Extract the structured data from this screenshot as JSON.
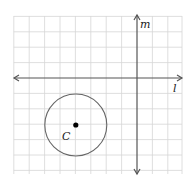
{
  "diagram": {
    "grid": {
      "cols": 11,
      "rows": 10,
      "color": "#d4d4d4"
    },
    "axes": {
      "horizontal_label": "l",
      "vertical_label": "m",
      "color": "#555555"
    },
    "circle": {
      "center_label": "C",
      "center": [
        -4,
        -3
      ],
      "radius": 2,
      "stroke": "#666666"
    }
  }
}
